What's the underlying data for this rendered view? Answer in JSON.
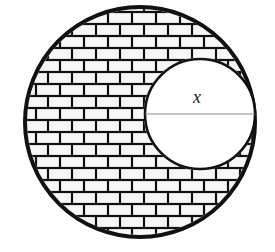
{
  "figure": {
    "background_color": "#ffffff",
    "stroke_color": "#111111",
    "mortar_color": "#111111",
    "brick_face_color": "#f7f7f7",
    "diameter_line_color": "#8a8a8a",
    "label_color": "#1a1a1a"
  },
  "outer_circle": {
    "name": "large-brick-circle",
    "center_x": 140,
    "center_y": 122,
    "radius": 115,
    "stroke_width": 4,
    "fill": "brick-hatch"
  },
  "inner_circle": {
    "name": "small-white-circle",
    "center_x": 200,
    "center_y": 114,
    "radius": 55,
    "stroke_width": 2.6,
    "fill": "#ffffff"
  },
  "diameter": {
    "name": "inner-circle-diameter",
    "x1": 145,
    "x2": 255,
    "y": 114,
    "stroke_width": 1.2
  },
  "labels": {
    "x_label": {
      "text": "x",
      "x": 197,
      "y": 103,
      "font_size": 18
    }
  },
  "brick_pattern": {
    "brick_width": 24,
    "brick_height": 12,
    "mortar_thickness": 2.2,
    "bond": "running"
  }
}
